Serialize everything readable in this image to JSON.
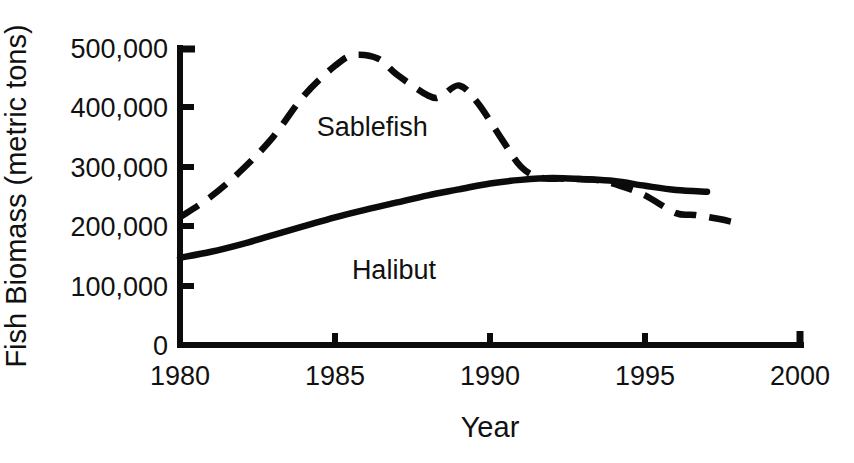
{
  "chart_data": {
    "type": "line",
    "title": "",
    "xlabel": "Year",
    "ylabel": "Fish Biomass (metric tons)",
    "xlim": [
      1980,
      2000
    ],
    "ylim": [
      0,
      500000
    ],
    "grid": false,
    "legend": "inline-annotations",
    "xticks": [
      "1980",
      "1985",
      "1990",
      "1995",
      "2000"
    ],
    "xtick_values": [
      1980,
      1985,
      1990,
      1995,
      2000
    ],
    "yticks": [
      "0",
      "100,000",
      "200,000",
      "300,000",
      "400,000",
      "500,000"
    ],
    "ytick_values": [
      0,
      100000,
      200000,
      300000,
      400000,
      500000
    ],
    "series": [
      {
        "name": "Sablefish",
        "style": "dashed",
        "color": "#0b0b0b",
        "label_x": 1986.2,
        "label_y": 352000,
        "x": [
          1980,
          1981,
          1982,
          1983,
          1984,
          1985,
          1985.6,
          1986.4,
          1987,
          1988,
          1988.4,
          1989,
          1989.6,
          1990.4,
          1991,
          1991.6,
          1992.4,
          1993.4,
          1994.2,
          1995,
          1996,
          1996.6,
          1997.4,
          1998
        ],
        "y": [
          215000,
          250000,
          295000,
          350000,
          420000,
          470000,
          488000,
          482000,
          455000,
          420000,
          418000,
          437000,
          408000,
          345000,
          300000,
          282000,
          280000,
          278000,
          268000,
          252000,
          222000,
          219000,
          212000,
          205000
        ]
      },
      {
        "name": "Halibut",
        "style": "solid",
        "color": "#0b0b0b",
        "label_x": 1986.9,
        "label_y": 112000,
        "x": [
          1980,
          1981,
          1982,
          1983,
          1984,
          1985,
          1986,
          1987,
          1988,
          1989,
          1990,
          1991,
          1992,
          1993,
          1994,
          1995,
          1996,
          1997
        ],
        "y": [
          147000,
          157000,
          170000,
          185000,
          200000,
          215000,
          228000,
          240000,
          252000,
          262000,
          272000,
          278000,
          281000,
          279000,
          276000,
          268000,
          261000,
          258000
        ]
      }
    ]
  },
  "axes": {
    "x_axis_name": "x-axis",
    "y_axis_name": "y-axis"
  },
  "caption": {
    "text": ""
  }
}
